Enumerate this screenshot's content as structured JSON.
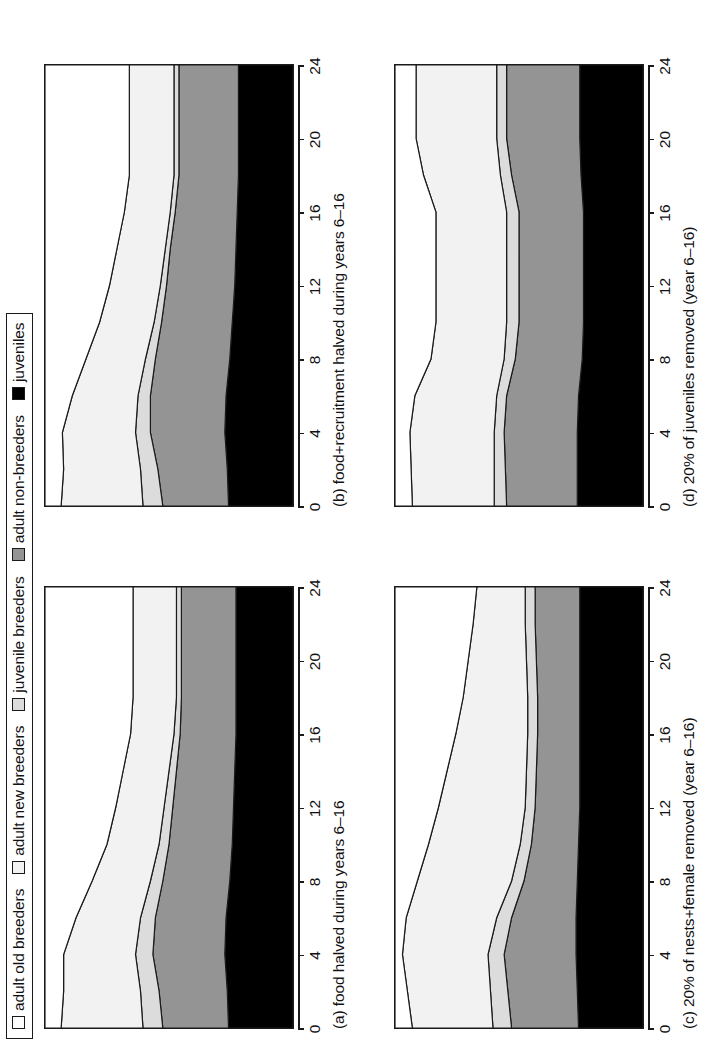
{
  "legend": {
    "items": [
      {
        "label": "adult old breeders",
        "color": "#ffffff",
        "icon": "square-swatch-icon"
      },
      {
        "label": "adult new breeders",
        "color": "#f2f2f2",
        "icon": "square-swatch-icon"
      },
      {
        "label": "juvenile breeders",
        "color": "#dcdcdc",
        "icon": "square-swatch-icon"
      },
      {
        "label": "adult non-breeders",
        "color": "#949494",
        "icon": "square-swatch-icon"
      },
      {
        "label": "juveniles",
        "color": "#000000",
        "icon": "square-swatch-icon"
      }
    ]
  },
  "axis": {
    "ticks": [
      "0",
      "4",
      "8",
      "12",
      "16",
      "20",
      "24"
    ],
    "tick_values": [
      0,
      4,
      8,
      12,
      16,
      20,
      24
    ],
    "xlim": [
      0,
      24
    ]
  },
  "chart_data": [
    {
      "id": "panel-a",
      "type": "area",
      "title": "(a)  food halved during years 6–16",
      "panel_letter": "(a)",
      "caption": "food halved during years 6–16",
      "xlabel": "",
      "ylabel": "",
      "xlim": [
        0,
        24
      ],
      "ylim": [
        0,
        100
      ],
      "grid": false,
      "legend_position": "top",
      "x": [
        0,
        2,
        4,
        6,
        8,
        10,
        12,
        14,
        16,
        18,
        20,
        22,
        24
      ],
      "series": [
        {
          "name": "juveniles",
          "values": [
            26.0,
            26.5,
            27.5,
            27.0,
            25.5,
            24.5,
            24.0,
            23.5,
            23.0,
            23.0,
            23.0,
            23.0,
            23.0
          ]
        },
        {
          "name": "adult non-breeders",
          "values": [
            26.5,
            27.5,
            29.0,
            28.5,
            27.0,
            25.5,
            24.5,
            23.5,
            22.5,
            22.0,
            22.0,
            22.0,
            22.0
          ]
        },
        {
          "name": "juvenile breeders",
          "values": [
            8.0,
            7.5,
            7.0,
            6.0,
            5.0,
            4.0,
            3.5,
            3.0,
            2.5,
            2.0,
            2.0,
            2.0,
            2.0
          ]
        },
        {
          "name": "adult new breeders",
          "values": [
            33.0,
            31.0,
            29.0,
            26.0,
            23.5,
            21.0,
            19.5,
            18.5,
            17.5,
            17.5,
            17.5,
            17.5,
            17.5
          ]
        },
        {
          "name": "adult old breeders",
          "values": [
            6.5,
            7.5,
            7.5,
            12.5,
            19.0,
            25.0,
            28.5,
            31.5,
            34.5,
            35.5,
            35.5,
            35.5,
            35.5
          ]
        }
      ]
    },
    {
      "id": "panel-b",
      "type": "area",
      "title": "(b)  food+recruitment halved during years 6–16",
      "panel_letter": "(b)",
      "caption": "food+recruitment halved during years 6–16",
      "xlabel": "",
      "ylabel": "",
      "xlim": [
        0,
        24
      ],
      "ylim": [
        0,
        100
      ],
      "grid": false,
      "legend_position": "top",
      "x": [
        0,
        2,
        4,
        6,
        8,
        10,
        12,
        14,
        16,
        18,
        20,
        22,
        24
      ],
      "series": [
        {
          "name": "juveniles",
          "values": [
            26.0,
            26.5,
            27.5,
            27.0,
            25.5,
            24.5,
            23.5,
            23.0,
            22.5,
            22.0,
            22.0,
            22.0,
            22.0
          ]
        },
        {
          "name": "adult non-breeders",
          "values": [
            26.5,
            28.0,
            30.0,
            30.5,
            30.0,
            28.5,
            27.5,
            26.5,
            25.0,
            24.0,
            24.0,
            24.0,
            24.0
          ]
        },
        {
          "name": "juvenile breeders",
          "values": [
            8.0,
            7.0,
            6.0,
            5.0,
            4.0,
            3.0,
            2.5,
            2.0,
            2.0,
            2.0,
            2.0,
            2.0,
            2.0
          ]
        },
        {
          "name": "adult new breeders",
          "values": [
            33.0,
            31.0,
            29.5,
            26.5,
            24.0,
            22.0,
            20.5,
            19.5,
            18.5,
            18.0,
            18.0,
            18.0,
            18.0
          ]
        },
        {
          "name": "adult old breeders",
          "values": [
            6.5,
            7.5,
            7.0,
            11.0,
            16.5,
            22.0,
            26.0,
            29.0,
            32.0,
            34.0,
            34.0,
            34.0,
            34.0
          ]
        }
      ]
    },
    {
      "id": "panel-c",
      "type": "area",
      "title": "(c)  20% of nests+female removed (year 6–16)",
      "panel_letter": "(c)",
      "caption": "20% of nests+female removed (year 6–16)",
      "xlabel": "",
      "ylabel": "",
      "xlim": [
        0,
        24
      ],
      "ylim": [
        0,
        100
      ],
      "grid": false,
      "legend_position": "top",
      "x": [
        0,
        2,
        4,
        6,
        8,
        10,
        12,
        14,
        16,
        18,
        20,
        22,
        24
      ],
      "series": [
        {
          "name": "juveniles",
          "values": [
            26.0,
            26.5,
            27.0,
            27.0,
            26.5,
            26.0,
            25.5,
            25.5,
            25.5,
            25.5,
            25.5,
            25.5,
            25.5
          ]
        },
        {
          "name": "adult non-breeders",
          "values": [
            27.0,
            28.0,
            29.0,
            26.0,
            21.5,
            19.0,
            18.0,
            17.5,
            17.0,
            17.0,
            17.5,
            18.0,
            18.0
          ]
        },
        {
          "name": "juvenile breeders",
          "values": [
            7.5,
            7.0,
            6.5,
            6.0,
            5.0,
            4.5,
            4.0,
            4.0,
            4.0,
            4.0,
            4.0,
            4.0,
            4.0
          ]
        },
        {
          "name": "adult new breeders",
          "values": [
            32.5,
            33.5,
            34.5,
            36.5,
            38.0,
            37.0,
            35.0,
            32.0,
            29.0,
            26.0,
            23.5,
            21.0,
            19.5
          ]
        },
        {
          "name": "adult old breeders",
          "values": [
            7.0,
            5.0,
            3.0,
            4.5,
            9.0,
            13.5,
            17.5,
            21.0,
            24.5,
            27.5,
            29.5,
            31.5,
            33.0
          ]
        }
      ]
    },
    {
      "id": "panel-d",
      "type": "area",
      "title": "(d)  20% of juveniles removed (year 6–16)",
      "panel_letter": "(d)",
      "caption": "20% of juveniles removed (year 6–16)",
      "xlabel": "",
      "ylabel": "",
      "xlim": [
        0,
        24
      ],
      "ylim": [
        0,
        100
      ],
      "grid": false,
      "legend_position": "top",
      "x": [
        0,
        2,
        4,
        6,
        8,
        10,
        12,
        14,
        16,
        18,
        20,
        22,
        24
      ],
      "series": [
        {
          "name": "juveniles",
          "values": [
            26.5,
            26.5,
            26.5,
            26.0,
            24.5,
            24.0,
            24.0,
            24.0,
            24.0,
            25.0,
            25.5,
            25.5,
            25.5
          ]
        },
        {
          "name": "adult non-breeders",
          "values": [
            28.5,
            29.0,
            29.5,
            29.0,
            27.0,
            26.0,
            26.0,
            26.0,
            26.0,
            28.0,
            29.5,
            29.5,
            29.5
          ]
        },
        {
          "name": "juvenile breeders",
          "values": [
            5.0,
            4.5,
            4.0,
            4.0,
            4.5,
            5.0,
            5.0,
            5.0,
            5.0,
            4.5,
            4.0,
            4.0,
            4.0
          ]
        },
        {
          "name": "adult new breeders",
          "values": [
            33.0,
            33.5,
            34.0,
            33.0,
            29.5,
            28.5,
            28.5,
            28.5,
            28.5,
            31.0,
            32.5,
            32.5,
            32.5
          ]
        },
        {
          "name": "adult old breeders",
          "values": [
            7.0,
            6.5,
            6.0,
            8.0,
            14.5,
            16.5,
            16.5,
            16.5,
            16.5,
            11.5,
            8.5,
            8.5,
            8.5
          ]
        }
      ]
    }
  ]
}
